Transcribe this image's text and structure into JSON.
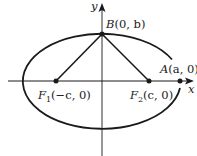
{
  "figure": {
    "type": "ellipse-diagram",
    "axes": {
      "x_label": "x",
      "y_label": "y"
    },
    "points": {
      "B": {
        "name": "B",
        "coords": "(0, b)",
        "text": "B(0, b)"
      },
      "A": {
        "name": "A",
        "coords": "(a, 0)",
        "text": "A(a, 0)"
      },
      "F1": {
        "name": "F",
        "subscript": "1",
        "coords": "(−c, 0)",
        "text": "F1(−c, 0)"
      },
      "F2": {
        "name": "F",
        "subscript": "2",
        "coords": "(c, 0)",
        "text": "F2(c, 0)"
      }
    },
    "segments": [
      "F1–B",
      "B–F2"
    ],
    "colors": {
      "ink": "#1a1a1a",
      "background": "#ffffff"
    }
  }
}
